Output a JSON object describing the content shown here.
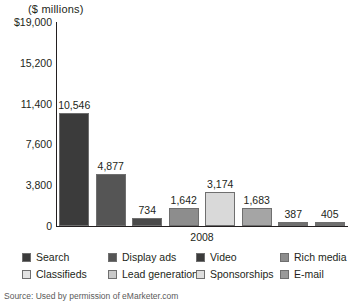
{
  "chart_data": {
    "type": "bar",
    "title": "($ millions)",
    "xlabel": "2008",
    "ylabel": "($ millions)",
    "categories": [
      "Search",
      "Display ads",
      "Classifieds",
      "Lead generation",
      "Video",
      "Rich media",
      "Sponsorships",
      "E-mail"
    ],
    "values": [
      10546,
      4877,
      734,
      1642,
      3174,
      1683,
      387,
      405
    ],
    "value_labels": [
      "10,546",
      "4,877",
      "734",
      "1,642",
      "3,174",
      "1,683",
      "387",
      "405"
    ],
    "bar_colors": [
      "#3b3b3b",
      "#555555",
      "#4a4a4a",
      "#8d8d8d",
      "#d9d9d9",
      "#a5a5a5",
      "#6f6f6f",
      "#6f6f6f"
    ],
    "ylim": [
      0,
      19000
    ],
    "yticks": [
      0,
      3800,
      7600,
      11400,
      15200,
      19000
    ],
    "ytick_labels": [
      "0",
      "3,800",
      "7,600",
      "11,400",
      "15,200",
      "$19,000"
    ],
    "grid": false,
    "legend_position": "bottom"
  },
  "legend": {
    "entries": [
      {
        "label": "Search",
        "color": "#3b3b3b"
      },
      {
        "label": "Display ads",
        "color": "#555555"
      },
      {
        "label": "Video",
        "color": "#3b3b3b"
      },
      {
        "label": "Rich media",
        "color": "#8d8d8d"
      },
      {
        "label": "Classifieds",
        "color": "#e3e3e3"
      },
      {
        "label": "Lead generation",
        "color": "#c9c9c9"
      },
      {
        "label": "Sponsorships",
        "color": "#dedede"
      },
      {
        "label": "E-mail",
        "color": "#9a9a9a"
      }
    ]
  },
  "footer": {
    "source": "Source: Used by permission of eMarketer.com"
  }
}
